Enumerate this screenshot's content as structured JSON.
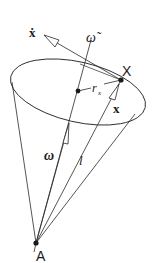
{
  "diagram": {
    "type": "cone-rotation-diagram",
    "labels": {
      "x_dot": "ẋ",
      "omega_tilde": "ω̃",
      "point_X": "X",
      "r_x": "r",
      "r_x_sub": "x",
      "x_vec": "x",
      "omega": "ω",
      "l": "l",
      "point_A": "A"
    },
    "points": {
      "A": [
        36,
        243
      ],
      "X": [
        121,
        80
      ],
      "center": [
        78,
        91
      ]
    },
    "colors": {
      "stroke": "#2a2a2a",
      "background": "#ffffff"
    }
  }
}
